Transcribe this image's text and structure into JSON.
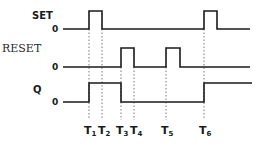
{
  "diagram": {
    "type": "timing-diagram",
    "signals": [
      {
        "name": "SET",
        "zero_label": "0",
        "baseline_y": 29,
        "high_y": 11,
        "pulses": [
          {
            "from": "T1",
            "to": "T2"
          },
          {
            "from": "T6",
            "to": null
          }
        ]
      },
      {
        "name": "RESET",
        "zero_label": "0",
        "baseline_y": 67,
        "high_y": 48,
        "pulses": [
          {
            "from": "T3",
            "to": "T4"
          },
          {
            "from": "T5",
            "to": null
          }
        ]
      },
      {
        "name": "Q",
        "zero_label": "0",
        "baseline_y": 102,
        "high_y": 83,
        "pulses": [
          {
            "from": "T1",
            "to": "T3"
          },
          {
            "from": "T6",
            "to": "end"
          }
        ]
      }
    ],
    "time_markers": [
      {
        "label": "T",
        "sub": "1",
        "x": 89
      },
      {
        "label": "T",
        "sub": "2",
        "x": 102
      },
      {
        "label": "T",
        "sub": "3",
        "x": 121
      },
      {
        "label": "T",
        "sub": "4",
        "x": 134
      },
      {
        "label": "T",
        "sub": "5",
        "x": 166
      },
      {
        "label": "T",
        "sub": "6",
        "x": 204
      }
    ],
    "colors": {
      "line": "#1a1a1a",
      "guide": "#555555",
      "background": "#ffffff"
    }
  }
}
